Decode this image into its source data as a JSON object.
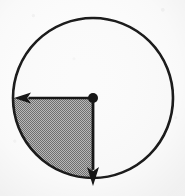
{
  "figure": {
    "kind": "geometry-diagram",
    "background_color": "#fdfdfd",
    "stroke_color": "#1a1a1a",
    "shaded_fill_color": "#a8a8a8",
    "unshaded_fill_color": "#fbfbfb"
  },
  "chart_data": {
    "type": "pie",
    "title": "",
    "subtitle": "",
    "xlabel": "",
    "ylabel": "",
    "legend_position": "none",
    "grid": false,
    "categories": [
      "shaded quadrant",
      "unshaded remainder"
    ],
    "values": [
      25,
      75
    ],
    "labels": [
      "",
      ""
    ],
    "colors": [
      "#a8a8a8",
      "#fbfbfb"
    ],
    "annotations": [
      {
        "name": "left-radius-arrow",
        "from_angle_deg": 0,
        "to_angle_deg": 180,
        "direction": "left",
        "length_px": 80,
        "label": ""
      },
      {
        "name": "down-radius-arrow",
        "from_angle_deg": 0,
        "to_angle_deg": 270,
        "direction": "down",
        "length_px": 80,
        "label": ""
      },
      {
        "name": "centre-point",
        "label": ""
      }
    ]
  },
  "circle": {
    "center_x": 93,
    "center_y": 98,
    "radius": 80,
    "stroke_width": 2.6,
    "stroke_color": "#1a1a1a",
    "fill_color": "#fbfbfb"
  },
  "shaded_sector": {
    "start_angle_deg": 180,
    "end_angle_deg": 270,
    "sweep_deg": 90,
    "fill_color": "#a8a8a8",
    "fraction_of_circle": "1/4"
  },
  "center_dot": {
    "cx": 93,
    "cy": 98,
    "r": 5,
    "color": "#141414"
  },
  "arrows": {
    "left": {
      "x1": 93,
      "y1": 98,
      "x2": 14,
      "y2": 98,
      "shaft_width": 2.6,
      "head_length": 17,
      "head_half_width": 5.5,
      "color": "#141414"
    },
    "down": {
      "x1": 93,
      "y1": 98,
      "x2": 93,
      "y2": 186,
      "shaft_width": 2.8,
      "head_length": 19,
      "head_half_width": 6,
      "color": "#141414"
    }
  },
  "texture": {
    "halftone_dot_spacing": 2,
    "halftone_dot_color": "#6f6f6f",
    "halftone_base_color": "#b9b9b9",
    "paper_speckle": true
  }
}
